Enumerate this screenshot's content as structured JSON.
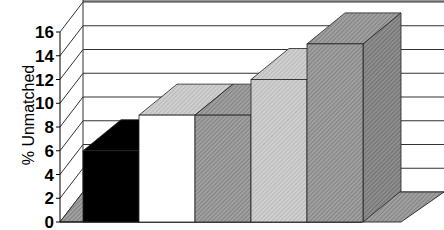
{
  "chart_data": {
    "type": "bar",
    "style": "3d-column",
    "title": "",
    "xlabel": "",
    "ylabel": "% Unmatched",
    "ylim": [
      0,
      16
    ],
    "yticks": [
      0,
      2,
      4,
      6,
      8,
      10,
      12,
      14,
      16
    ],
    "grid": true,
    "legend": null,
    "categories": [
      "",
      "",
      "",
      "",
      ""
    ],
    "values": [
      6,
      9,
      9,
      12,
      15
    ],
    "bar_fills": [
      "black",
      "white",
      "dark-hatched-gray",
      "light-hatched-gray",
      "dark-hatched-gray"
    ]
  },
  "colors": {
    "bar1": "#000000",
    "bar2": "#ffffff",
    "bar3": "#9a9a9a",
    "bar4": "#c8c8c8",
    "bar5": "#9a9a9a",
    "floor": "#a8a8a8",
    "grid": "#000000"
  },
  "axis": {
    "ylabel": "% Unmatched",
    "ticks": [
      "16",
      "14",
      "12",
      "10",
      "8",
      "6",
      "4",
      "2",
      "0"
    ]
  }
}
